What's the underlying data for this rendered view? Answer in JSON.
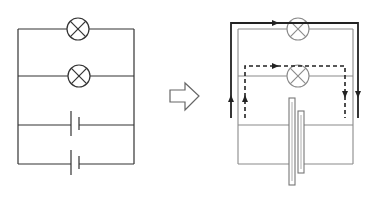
{
  "diagram": {
    "colors": {
      "wire_left": "#333333",
      "wire_right": "#8a8a8a",
      "current_path": "#222222",
      "arrow_outline": "#666666"
    },
    "left_circuit": {
      "name": "original-parallel-circuit",
      "lamps": 2,
      "cells": 2
    },
    "transform_arrow": {
      "name": "transform-arrow",
      "direction": "right"
    },
    "right_circuit": {
      "name": "current-path-circuit",
      "lamps": 2,
      "current_paths": [
        {
          "style": "solid",
          "through": "lamp-1",
          "direction": "clockwise"
        },
        {
          "style": "dashed",
          "through": "lamp-2",
          "direction": "clockwise"
        }
      ],
      "combined_cell": "two stacked plates (merged battery)"
    }
  }
}
